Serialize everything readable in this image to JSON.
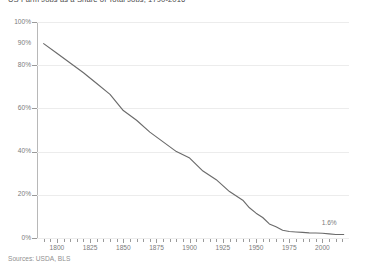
{
  "title": "US Farm Jobs as a Share of Total Jobs, 1790-2016",
  "sources": "Sources: USDA, BLS",
  "endpoint_annotation": "1.6%",
  "colors": {
    "line": "#6b6b6b",
    "grid": "#ececec",
    "axis": "#8c8c8c",
    "text": "#7b7b7b",
    "background": "#ffffff"
  },
  "chart_data": {
    "type": "line",
    "title": "US Farm Jobs as a Share of Total Jobs, 1790-2016",
    "xlabel": "",
    "ylabel": "",
    "xlim": [
      1785,
      2020
    ],
    "ylim": [
      0,
      100
    ],
    "grid": true,
    "legend": false,
    "y_tick_labels": [
      "100%",
      "90%",
      "80%",
      "60%",
      "40%",
      "20%",
      "0%"
    ],
    "y_tick_values": [
      100,
      90,
      80,
      60,
      40,
      20,
      0
    ],
    "y_gridline_values": [
      100,
      80,
      60,
      40,
      20,
      0
    ],
    "x_tick_labels": [
      "1800",
      "1825",
      "1850",
      "1875",
      "1900",
      "1925",
      "1950",
      "1975",
      "2000"
    ],
    "x_tick_values": [
      1800,
      1825,
      1850,
      1875,
      1900,
      1925,
      1950,
      1975,
      2000
    ],
    "x_minor_step": 5,
    "annotations": [
      {
        "text": "1.6%",
        "x": 2016,
        "y": 1.6
      }
    ],
    "series": [
      {
        "name": "Farm jobs share of total jobs",
        "x": [
          1790,
          1800,
          1810,
          1820,
          1830,
          1840,
          1850,
          1860,
          1870,
          1880,
          1890,
          1900,
          1910,
          1920,
          1930,
          1940,
          1945,
          1950,
          1955,
          1960,
          1965,
          1970,
          1975,
          1980,
          1985,
          1990,
          1995,
          2000,
          2005,
          2010,
          2016
        ],
        "values": [
          90.0,
          85.5,
          81.0,
          76.5,
          71.5,
          66.5,
          59.0,
          54.5,
          49.0,
          44.5,
          40.0,
          37.0,
          31.0,
          27.0,
          21.5,
          17.5,
          14.0,
          11.5,
          9.5,
          6.5,
          5.2,
          3.6,
          3.0,
          2.8,
          2.6,
          2.4,
          2.3,
          2.2,
          1.9,
          1.6,
          1.6
        ]
      }
    ]
  }
}
